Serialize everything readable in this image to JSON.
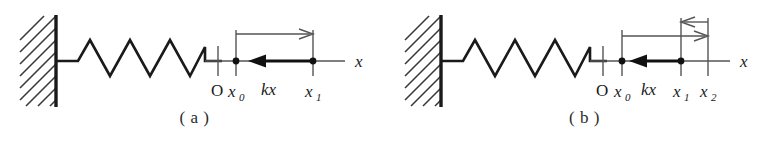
{
  "figure": {
    "background_color": "#ffffff",
    "ink_color": "#1a1a1a",
    "thin_line_color": "#555555"
  },
  "panels": [
    {
      "id": "a",
      "caption": "( a )",
      "wall": {
        "name": "hatched-wall",
        "hatch_direction": "up-right"
      },
      "spring": {
        "name": "coil-spring",
        "peaks": 4
      },
      "axis_label": "x",
      "origin_label": "O",
      "markers": [
        {
          "name": "x0",
          "label": "x",
          "subscript": "0",
          "dot": true
        },
        {
          "name": "x1",
          "label": "x",
          "subscript": "1",
          "dot": true
        }
      ],
      "force_label": "kx",
      "force_direction": "left",
      "displacement_arrows": [
        {
          "name": "x0-to-x1",
          "from": "x0",
          "to": "x1",
          "direction": "right"
        }
      ]
    },
    {
      "id": "b",
      "caption": "( b )",
      "wall": {
        "name": "hatched-wall",
        "hatch_direction": "up-right"
      },
      "spring": {
        "name": "coil-spring",
        "peaks": 4
      },
      "axis_label": "x",
      "origin_label": "O",
      "markers": [
        {
          "name": "x0",
          "label": "x",
          "subscript": "0",
          "dot": true
        },
        {
          "name": "x1",
          "label": "x",
          "subscript": "1",
          "dot": true
        },
        {
          "name": "x2",
          "label": "x",
          "subscript": "2",
          "dot": false
        }
      ],
      "force_label": "kx",
      "force_direction": "left",
      "displacement_arrows": [
        {
          "name": "x0-to-x1",
          "from": "x0",
          "to": "x1",
          "direction": "right"
        },
        {
          "name": "x2-to-x1",
          "from": "x2",
          "to": "x1",
          "direction": "left"
        }
      ]
    }
  ]
}
